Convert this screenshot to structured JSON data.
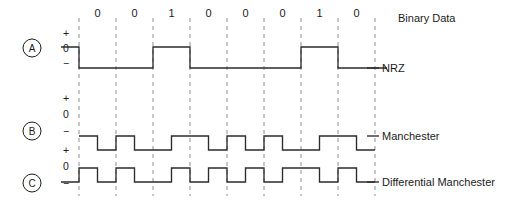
{
  "figure": {
    "bit_count": 8,
    "bits": [
      "0",
      "0",
      "1",
      "0",
      "0",
      "0",
      "1",
      "0"
    ],
    "colors": {
      "wave": "#2b2b2b",
      "grid": "#8e8e8e",
      "text": "#1b1b1b",
      "background": "#ffffff"
    }
  },
  "rows": [
    {
      "marker": "A",
      "right_labels": [
        "Binary Data",
        "NRZ"
      ],
      "axis_labels": [
        "+",
        "0",
        "−"
      ]
    },
    {
      "marker": "B",
      "right_labels": [
        "Manchester"
      ],
      "axis_labels": [
        "+",
        "0",
        "−"
      ]
    },
    {
      "marker": "C",
      "right_labels": [
        "Differential Manchester"
      ],
      "axis_labels": [
        "+",
        "0",
        "−"
      ]
    }
  ],
  "labels": {
    "binary_data": "Binary Data",
    "nrz": "NRZ",
    "manchester": "Manchester",
    "differential_manchester": "Differential Manchester",
    "marker_a": "A",
    "marker_b": "B",
    "marker_c": "C",
    "plus": "+",
    "zero": "0",
    "minus": "−"
  },
  "chart_data": {
    "type": "line",
    "xlabel": "",
    "ylabel": "",
    "grid": true,
    "legend_position": "right",
    "categories": [
      "0",
      "0",
      "1",
      "0",
      "0",
      "0",
      "1",
      "0"
    ],
    "bit_period": 37,
    "x_start": 79,
    "gridline_x": [
      79,
      116,
      153,
      190,
      227,
      264,
      301,
      338,
      375
    ],
    "series": [
      {
        "name": "NRZ",
        "description": "Non-return-to-zero level: high = 1, low = 0; signal shown with lead-in high segment",
        "levels": [
          "high",
          "low",
          "low",
          "high",
          "low",
          "low",
          "low",
          "high",
          "low"
        ]
      },
      {
        "name": "Manchester",
        "description": "Mid-bit transition encodes data: 0 = high-to-low, 1 = low-to-high",
        "levels": [
          "low-high",
          "low-high",
          "high-low",
          "low-high",
          "low-high",
          "low-high",
          "high-low",
          "low-high"
        ]
      },
      {
        "name": "Differential Manchester",
        "description": "Always mid-bit transition; 0 = transition at start of bit, 1 = no transition at start",
        "levels": [
          "transition",
          "transition",
          "none",
          "transition",
          "transition",
          "transition",
          "none",
          "transition"
        ]
      }
    ]
  }
}
